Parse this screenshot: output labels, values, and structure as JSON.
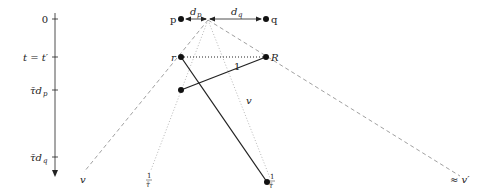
{
  "axis": {
    "ticks": [
      {
        "label": "0",
        "y": 19
      },
      {
        "label": "t = t′",
        "y": 57
      },
      {
        "label": "τ̄d",
        "sub": "p",
        "y": 90
      },
      {
        "label": "τ̄d",
        "sub": "q",
        "y": 157
      }
    ]
  },
  "points": {
    "p": {
      "label": "p"
    },
    "q": {
      "label": "q"
    },
    "r": {
      "label": "r"
    },
    "R": {
      "label": "R"
    }
  },
  "distances": {
    "dp": {
      "label": "d",
      "sub": "p"
    },
    "dq": {
      "label": "d",
      "sub": "q"
    }
  },
  "edges": {
    "rR_label": "1",
    "v_label": "v"
  },
  "cone_labels": {
    "left_dashed": "v",
    "right_dashed": "≈ v′",
    "dotted_num": "1",
    "dotted_den": "τ̄"
  },
  "colors": {
    "ink": "#222222",
    "gray": "#888888"
  }
}
